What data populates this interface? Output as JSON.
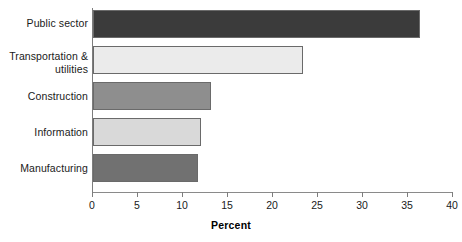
{
  "chart_data": {
    "type": "bar",
    "orientation": "horizontal",
    "title": "",
    "xlabel": "Percent",
    "ylabel": "",
    "xlim": [
      0,
      40
    ],
    "xticks": [
      "0",
      "5",
      "10",
      "15",
      "20",
      "25",
      "30",
      "35",
      "40"
    ],
    "grid": false,
    "legend": false,
    "categories": [
      "Public sector",
      "Transportation &\nutilities",
      "Construction",
      "Information",
      "Manufacturing"
    ],
    "values": [
      36.4,
      23.4,
      13.2,
      12.0,
      11.7
    ],
    "bar_colors": [
      "#3b3b3b",
      "#ebebeb",
      "#8e8e8e",
      "#d9d9d9",
      "#717171"
    ],
    "bar_edge_color": "#6a6a6a"
  },
  "labels": {
    "cat0_line1": "Public sector",
    "cat1_line1": "Transportation &",
    "cat1_line2": "utilities",
    "cat2_line1": "Construction",
    "cat3_line1": "Information",
    "cat4_line1": "Manufacturing"
  },
  "ticks": {
    "t0": "0",
    "t1": "5",
    "t2": "10",
    "t3": "15",
    "t4": "20",
    "t5": "25",
    "t6": "30",
    "t7": "35",
    "t8": "40"
  },
  "axis": {
    "x_title": "Percent"
  }
}
